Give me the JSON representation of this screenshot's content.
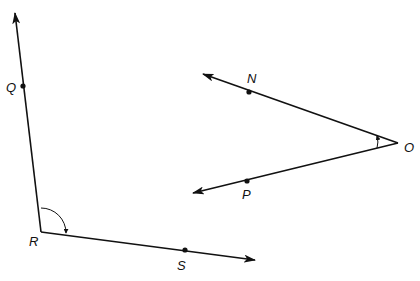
{
  "diagram": {
    "type": "geometry-angles",
    "stroke_color": "#111111",
    "background": "#ffffff",
    "angles": [
      {
        "name": "angle-QRS",
        "vertex": {
          "label": "R",
          "x": 41,
          "y": 232
        },
        "rays": [
          {
            "through": {
              "label": "Q",
              "x": 23,
              "y": 86
            },
            "tip": {
              "x": 15,
              "y": 12
            }
          },
          {
            "through": {
              "label": "S",
              "x": 185,
              "y": 250
            },
            "tip": {
              "x": 256,
              "y": 260
            }
          }
        ],
        "arc_marker": "obtuse arc with arrow"
      },
      {
        "name": "angle-NOP",
        "vertex": {
          "label": "O",
          "x": 398,
          "y": 143
        },
        "rays": [
          {
            "through": {
              "label": "N",
              "x": 249,
              "y": 92
            },
            "tip": {
              "x": 203,
              "y": 74
            }
          },
          {
            "through": {
              "label": "P",
              "x": 247,
              "y": 181
            },
            "tip": {
              "x": 193,
              "y": 193
            }
          }
        ],
        "arc_marker": "small acute arc with arrow"
      }
    ],
    "labels": {
      "Q": "Q",
      "R": "R",
      "S": "S",
      "N": "N",
      "O": "O",
      "P": "P"
    }
  }
}
